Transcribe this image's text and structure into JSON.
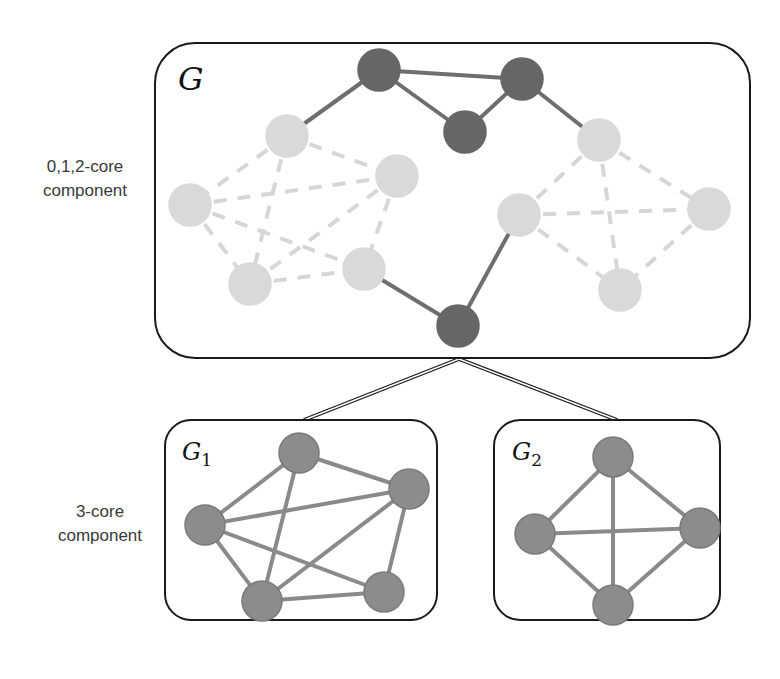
{
  "labels": {
    "top_component": [
      "0,1,2-core",
      "component"
    ],
    "bottom_component": [
      "3-core",
      "component"
    ]
  },
  "colors": {
    "box_stroke": "#1a1a1a",
    "dark_node": "#666666",
    "dark_edge": "#6e6e6e",
    "light_node": "#d9d9d9",
    "light_edge": "#d6d6d6",
    "core_node": "#8c8c8c",
    "core_node_stroke": "#7a7a7a",
    "core_edge": "#8a8a8a"
  },
  "graphs": [
    {
      "id": "G",
      "title": "G",
      "subscript": "",
      "box": {
        "x": 155,
        "y": 43,
        "w": 595,
        "h": 315,
        "r": 40
      },
      "title_pos": {
        "x": 178,
        "y": 90
      },
      "node_radius": 21,
      "nodes": [
        {
          "id": "d1",
          "x": 379,
          "y": 70,
          "kind": "dark"
        },
        {
          "id": "d2",
          "x": 522,
          "y": 79,
          "kind": "dark"
        },
        {
          "id": "d3",
          "x": 465,
          "y": 132,
          "kind": "dark"
        },
        {
          "id": "d4",
          "x": 458,
          "y": 326,
          "kind": "dark"
        },
        {
          "id": "a1",
          "x": 287,
          "y": 136,
          "kind": "light"
        },
        {
          "id": "a2",
          "x": 190,
          "y": 205,
          "kind": "light"
        },
        {
          "id": "a3",
          "x": 397,
          "y": 176,
          "kind": "light"
        },
        {
          "id": "a4",
          "x": 250,
          "y": 284,
          "kind": "light"
        },
        {
          "id": "a5",
          "x": 364,
          "y": 269,
          "kind": "light"
        },
        {
          "id": "b1",
          "x": 599,
          "y": 140,
          "kind": "light"
        },
        {
          "id": "b2",
          "x": 519,
          "y": 215,
          "kind": "light"
        },
        {
          "id": "b3",
          "x": 709,
          "y": 209,
          "kind": "light"
        },
        {
          "id": "b4",
          "x": 620,
          "y": 290,
          "kind": "light"
        }
      ],
      "edges": [
        {
          "from": "d1",
          "to": "d2",
          "style": "solid"
        },
        {
          "from": "d1",
          "to": "d3",
          "style": "solid"
        },
        {
          "from": "d3",
          "to": "d2",
          "style": "solid"
        },
        {
          "from": "d1",
          "to": "a1",
          "style": "solid"
        },
        {
          "from": "d2",
          "to": "b1",
          "style": "solid"
        },
        {
          "from": "a5",
          "to": "d4",
          "style": "solid"
        },
        {
          "from": "b2",
          "to": "d4",
          "style": "solid"
        },
        {
          "from": "a1",
          "to": "a2",
          "style": "dashed"
        },
        {
          "from": "a1",
          "to": "a3",
          "style": "dashed"
        },
        {
          "from": "a1",
          "to": "a4",
          "style": "dashed"
        },
        {
          "from": "a2",
          "to": "a3",
          "style": "dashed"
        },
        {
          "from": "a2",
          "to": "a4",
          "style": "dashed"
        },
        {
          "from": "a2",
          "to": "a5",
          "style": "dashed"
        },
        {
          "from": "a3",
          "to": "a4",
          "style": "dashed"
        },
        {
          "from": "a3",
          "to": "a5",
          "style": "dashed"
        },
        {
          "from": "a4",
          "to": "a5",
          "style": "dashed"
        },
        {
          "from": "b1",
          "to": "b2",
          "style": "dashed"
        },
        {
          "from": "b1",
          "to": "b3",
          "style": "dashed"
        },
        {
          "from": "b1",
          "to": "b4",
          "style": "dashed"
        },
        {
          "from": "b2",
          "to": "b3",
          "style": "dashed"
        },
        {
          "from": "b2",
          "to": "b4",
          "style": "dashed"
        },
        {
          "from": "b3",
          "to": "b4",
          "style": "dashed"
        }
      ]
    },
    {
      "id": "G1",
      "title": "G",
      "subscript": "1",
      "box": {
        "x": 165,
        "y": 420,
        "w": 272,
        "h": 200,
        "r": 26
      },
      "title_pos": {
        "x": 182,
        "y": 460
      },
      "node_radius": 20,
      "nodes": [
        {
          "id": "p1",
          "x": 299,
          "y": 453,
          "kind": "core"
        },
        {
          "id": "p2",
          "x": 409,
          "y": 489,
          "kind": "core"
        },
        {
          "id": "p3",
          "x": 205,
          "y": 525,
          "kind": "core"
        },
        {
          "id": "p4",
          "x": 262,
          "y": 601,
          "kind": "core"
        },
        {
          "id": "p5",
          "x": 384,
          "y": 592,
          "kind": "core"
        }
      ],
      "edges": [
        {
          "from": "p1",
          "to": "p2",
          "style": "core"
        },
        {
          "from": "p1",
          "to": "p3",
          "style": "core"
        },
        {
          "from": "p1",
          "to": "p4",
          "style": "core"
        },
        {
          "from": "p2",
          "to": "p3",
          "style": "core"
        },
        {
          "from": "p2",
          "to": "p4",
          "style": "core"
        },
        {
          "from": "p2",
          "to": "p5",
          "style": "core"
        },
        {
          "from": "p3",
          "to": "p4",
          "style": "core"
        },
        {
          "from": "p3",
          "to": "p5",
          "style": "core"
        },
        {
          "from": "p4",
          "to": "p5",
          "style": "core"
        }
      ]
    },
    {
      "id": "G2",
      "title": "G",
      "subscript": "2",
      "box": {
        "x": 494,
        "y": 420,
        "w": 226,
        "h": 200,
        "r": 26
      },
      "title_pos": {
        "x": 512,
        "y": 460
      },
      "node_radius": 20,
      "nodes": [
        {
          "id": "q1",
          "x": 613,
          "y": 457,
          "kind": "core"
        },
        {
          "id": "q2",
          "x": 535,
          "y": 534,
          "kind": "core"
        },
        {
          "id": "q3",
          "x": 700,
          "y": 528,
          "kind": "core"
        },
        {
          "id": "q4",
          "x": 613,
          "y": 605,
          "kind": "core"
        }
      ],
      "edges": [
        {
          "from": "q1",
          "to": "q2",
          "style": "core"
        },
        {
          "from": "q1",
          "to": "q3",
          "style": "core"
        },
        {
          "from": "q1",
          "to": "q4",
          "style": "core"
        },
        {
          "from": "q2",
          "to": "q3",
          "style": "core"
        },
        {
          "from": "q2",
          "to": "q4",
          "style": "core"
        },
        {
          "from": "q3",
          "to": "q4",
          "style": "core"
        }
      ]
    }
  ],
  "connector": {
    "apex": {
      "x": 459,
      "y": 359
    },
    "left": {
      "x": 304,
      "y": 420
    },
    "right": {
      "x": 617,
      "y": 420
    }
  }
}
